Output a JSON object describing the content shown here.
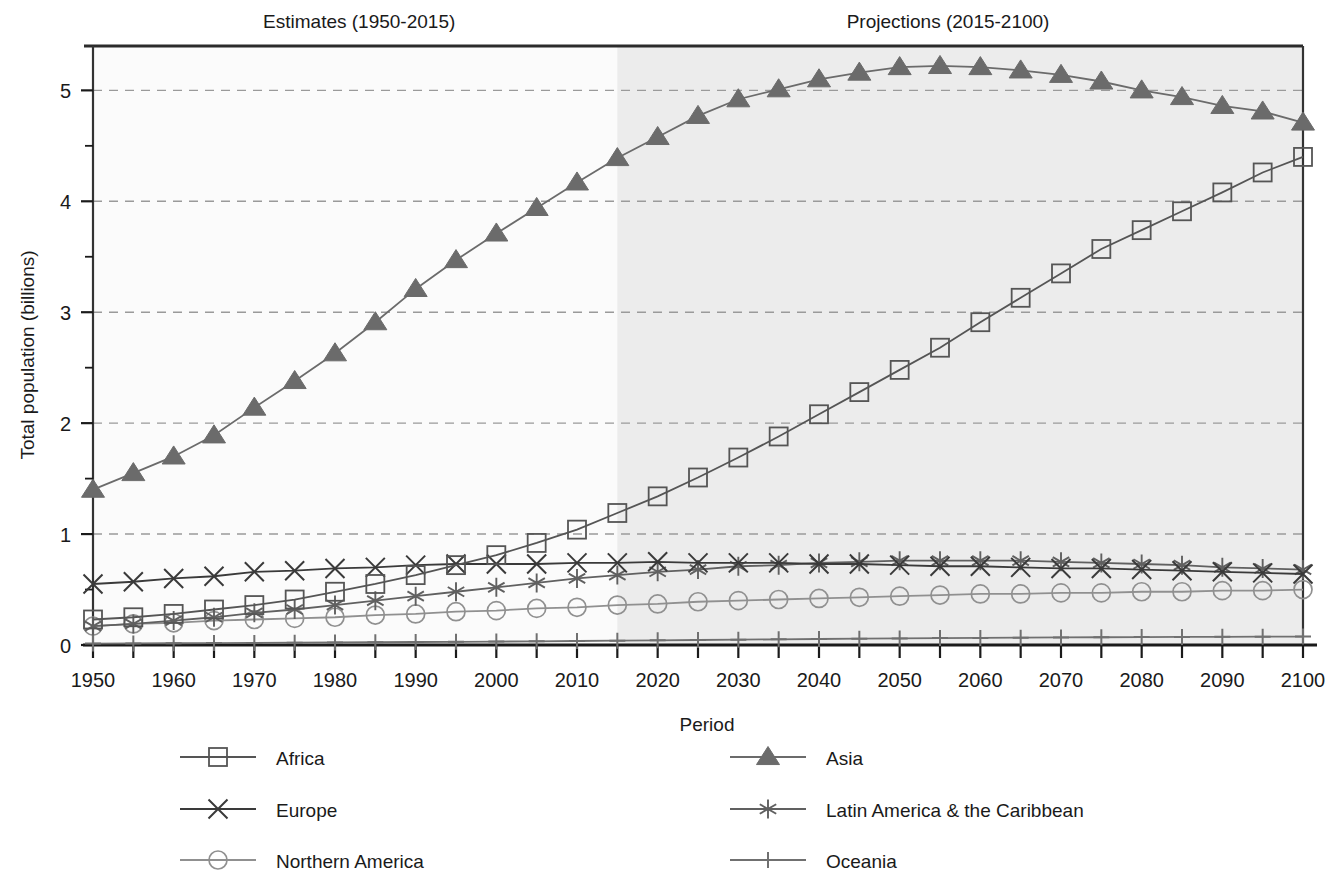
{
  "chart_data": {
    "type": "line",
    "title": "",
    "xlabel": "Period",
    "ylabel": "Total population (billions)",
    "xlim": [
      1950,
      2100
    ],
    "ylim": [
      0,
      5.4
    ],
    "y_ticks": [
      0,
      1,
      2,
      3,
      4,
      5
    ],
    "y_minor_ticks": [
      0.5,
      1.5,
      2.5,
      3.5,
      4.5
    ],
    "x_ticks": [
      1950,
      1955,
      1960,
      1965,
      1970,
      1975,
      1980,
      1985,
      1990,
      1995,
      2000,
      2005,
      2010,
      2015,
      2020,
      2025,
      2030,
      2035,
      2040,
      2045,
      2050,
      2055,
      2060,
      2065,
      2070,
      2075,
      2080,
      2085,
      2090,
      2095,
      2100
    ],
    "x_tick_labels": [
      "1950",
      "",
      "1960",
      "",
      "1970",
      "",
      "1980",
      "",
      "1990",
      "",
      "2000",
      "",
      "2010",
      "",
      "2020",
      "",
      "2030",
      "",
      "2040",
      "",
      "2050",
      "",
      "2060",
      "",
      "2070",
      "",
      "2080",
      "",
      "2090",
      "",
      "2100"
    ],
    "grid": "horizontal-dashed",
    "legend_position": "bottom",
    "annotations": [
      {
        "text": "Estimates (1950-2015)",
        "x": 1983
      },
      {
        "text": "Projections (2015-2100)",
        "x": 2056
      }
    ],
    "shaded_region": {
      "label": "Projections",
      "from": 2015,
      "to": 2100,
      "color": "#ececec"
    },
    "x": [
      1950,
      1955,
      1960,
      1965,
      1970,
      1975,
      1980,
      1985,
      1990,
      1995,
      2000,
      2005,
      2010,
      2015,
      2020,
      2025,
      2030,
      2035,
      2040,
      2045,
      2050,
      2055,
      2060,
      2065,
      2070,
      2075,
      2080,
      2085,
      2090,
      2095,
      2100
    ],
    "series": [
      {
        "name": "Africa",
        "marker": "square",
        "color": "#555555",
        "values": [
          0.23,
          0.25,
          0.28,
          0.32,
          0.36,
          0.41,
          0.48,
          0.55,
          0.63,
          0.72,
          0.81,
          0.92,
          1.04,
          1.19,
          1.34,
          1.51,
          1.69,
          1.88,
          2.08,
          2.28,
          2.48,
          2.68,
          2.91,
          3.13,
          3.35,
          3.57,
          3.74,
          3.91,
          4.08,
          4.26,
          4.4
        ]
      },
      {
        "name": "Asia",
        "marker": "triangle",
        "color": "#6b6b6b",
        "values": [
          1.4,
          1.55,
          1.7,
          1.89,
          2.14,
          2.38,
          2.63,
          2.91,
          3.21,
          3.47,
          3.71,
          3.94,
          4.17,
          4.39,
          4.58,
          4.77,
          4.92,
          5.01,
          5.1,
          5.16,
          5.21,
          5.22,
          5.21,
          5.18,
          5.14,
          5.08,
          5.0,
          4.94,
          4.86,
          4.81,
          4.71
        ]
      },
      {
        "name": "Europe",
        "marker": "cross",
        "color": "#3a3a3a",
        "values": [
          0.55,
          0.57,
          0.6,
          0.62,
          0.66,
          0.67,
          0.69,
          0.7,
          0.72,
          0.73,
          0.73,
          0.73,
          0.74,
          0.74,
          0.75,
          0.74,
          0.74,
          0.74,
          0.73,
          0.73,
          0.72,
          0.71,
          0.71,
          0.7,
          0.69,
          0.69,
          0.68,
          0.67,
          0.66,
          0.65,
          0.64
        ]
      },
      {
        "name": "Latin America & the Caribbean",
        "marker": "asterisk",
        "color": "#606060",
        "values": [
          0.17,
          0.19,
          0.22,
          0.25,
          0.29,
          0.32,
          0.36,
          0.4,
          0.44,
          0.48,
          0.52,
          0.56,
          0.6,
          0.63,
          0.66,
          0.68,
          0.71,
          0.72,
          0.74,
          0.75,
          0.76,
          0.76,
          0.76,
          0.76,
          0.75,
          0.74,
          0.73,
          0.72,
          0.7,
          0.69,
          0.68
        ]
      },
      {
        "name": "Northern America",
        "marker": "circle",
        "color": "#909090",
        "values": [
          0.17,
          0.19,
          0.2,
          0.22,
          0.23,
          0.24,
          0.25,
          0.27,
          0.28,
          0.3,
          0.31,
          0.33,
          0.34,
          0.36,
          0.37,
          0.39,
          0.4,
          0.41,
          0.42,
          0.43,
          0.44,
          0.45,
          0.46,
          0.46,
          0.47,
          0.47,
          0.48,
          0.48,
          0.49,
          0.49,
          0.5
        ]
      },
      {
        "name": "Oceania",
        "marker": "plus",
        "color": "#707070",
        "values": [
          0.013,
          0.014,
          0.016,
          0.017,
          0.019,
          0.021,
          0.023,
          0.025,
          0.027,
          0.029,
          0.031,
          0.033,
          0.036,
          0.039,
          0.042,
          0.045,
          0.048,
          0.051,
          0.054,
          0.057,
          0.059,
          0.062,
          0.064,
          0.066,
          0.068,
          0.07,
          0.071,
          0.073,
          0.074,
          0.075,
          0.076
        ]
      }
    ]
  },
  "legend": {
    "items": [
      {
        "label": "Africa",
        "marker": "square"
      },
      {
        "label": "Asia",
        "marker": "triangle"
      },
      {
        "label": "Europe",
        "marker": "cross"
      },
      {
        "label": "Latin America & the Caribbean",
        "marker": "asterisk"
      },
      {
        "label": "Northern America",
        "marker": "circle"
      },
      {
        "label": "Oceania",
        "marker": "plus"
      }
    ]
  },
  "colors": {
    "shaded_projection": "#ececec",
    "plot_background": "#fbfbfb",
    "grid_line": "#9a9a9a",
    "axis": "#1a1a1a"
  }
}
